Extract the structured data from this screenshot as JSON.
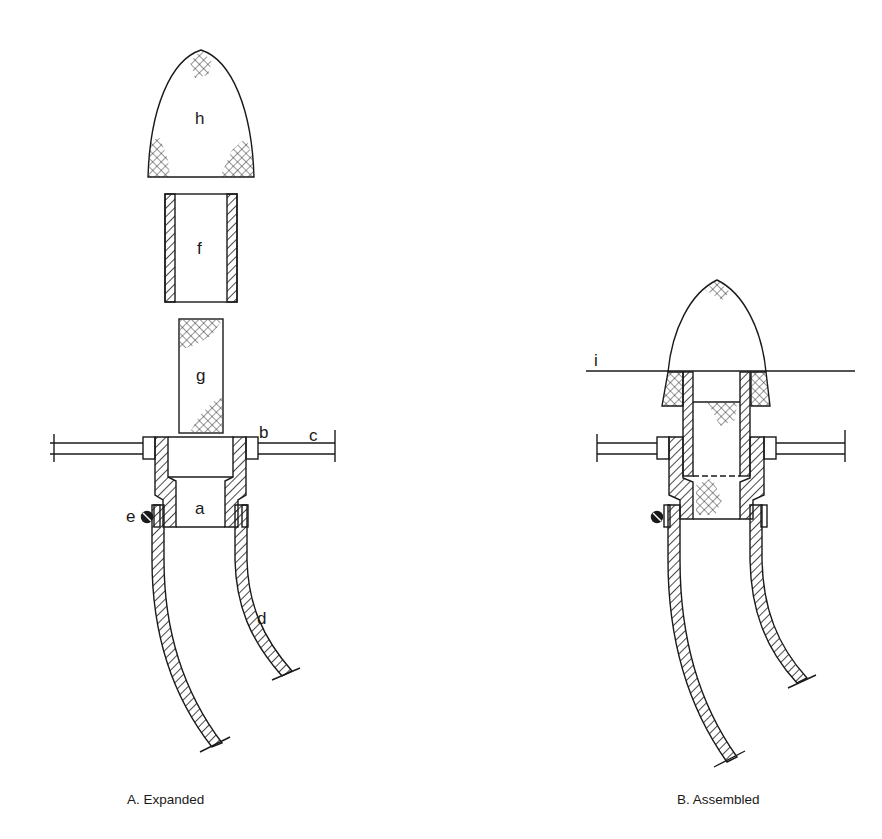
{
  "figure": {
    "panels": [
      {
        "id": "A",
        "caption": "A. Expanded",
        "labels": {
          "h": "h",
          "f": "f",
          "g": "g",
          "b": "b",
          "c": "c",
          "a": "a",
          "e": "e",
          "d": "d"
        }
      },
      {
        "id": "B",
        "caption": "B. Assembled",
        "labels": {
          "i": "i"
        }
      }
    ],
    "colors": {
      "ink": "#1a1a1a",
      "background": "#ffffff"
    }
  }
}
